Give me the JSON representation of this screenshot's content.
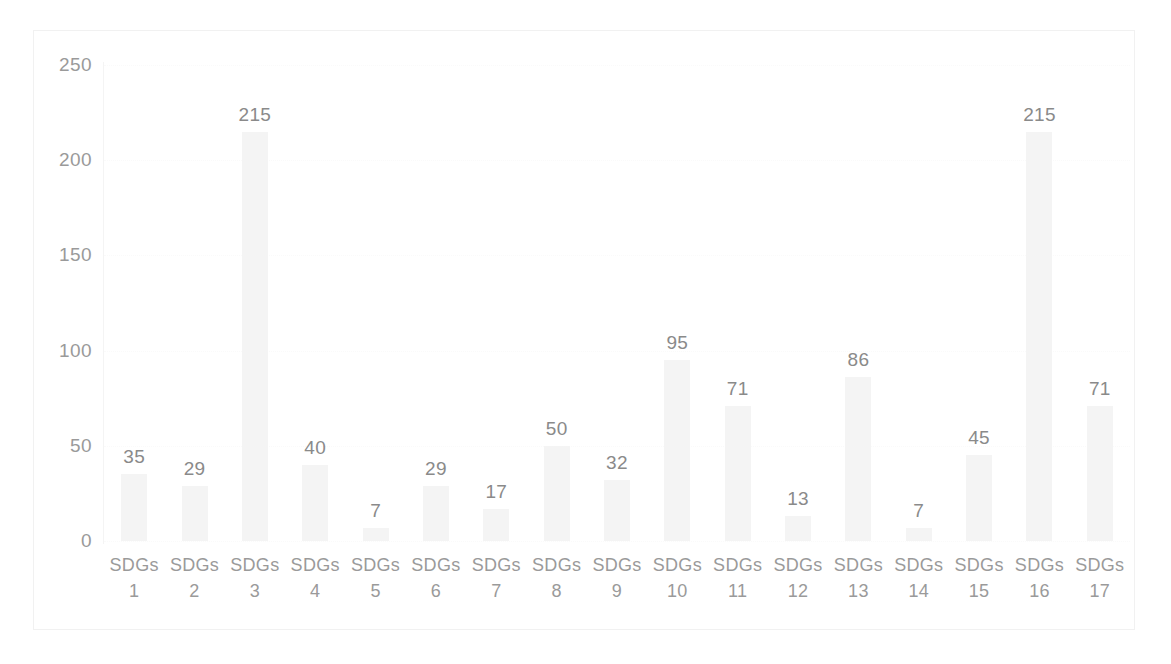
{
  "chart_data": {
    "type": "bar",
    "title": "",
    "subtitle": "",
    "xlabel": "",
    "ylabel": "",
    "categories": [
      "SDGs 1",
      "SDGs 2",
      "SDGs 3",
      "SDGs 4",
      "SDGs 5",
      "SDGs 6",
      "SDGs 7",
      "SDGs 8",
      "SDGs 9",
      "SDGs 10",
      "SDGs 11",
      "SDGs 12",
      "SDGs 13",
      "SDGs 14",
      "SDGs 15",
      "SDGs 16",
      "SDGs 17"
    ],
    "category_prefix": "SDGs",
    "category_numbers": [
      "1",
      "2",
      "3",
      "4",
      "5",
      "6",
      "7",
      "8",
      "9",
      "10",
      "11",
      "12",
      "13",
      "14",
      "15",
      "16",
      "17"
    ],
    "values": [
      35,
      29,
      215,
      40,
      7,
      29,
      17,
      50,
      32,
      95,
      71,
      13,
      86,
      7,
      45,
      215,
      71
    ],
    "value_labels": [
      "35",
      "29",
      "215",
      "40",
      "7",
      "29",
      "17",
      "50",
      "32",
      "95",
      "71",
      "13",
      "86",
      "7",
      "45",
      "215",
      "71"
    ],
    "ylim": [
      0,
      250
    ],
    "ytick_values": [
      0,
      50,
      100,
      150,
      200,
      250
    ],
    "ytick_labels": [
      "0",
      "50",
      "100",
      "150",
      "200",
      "250"
    ],
    "grid": true,
    "grid_axis": "y",
    "legend": false,
    "legend_position": "none",
    "data_labels": true,
    "bar_color": "#f4f4f4",
    "label_color": "#8a8a8a",
    "axis_label_color": "#9a9a9a",
    "gridline_color": "#fafafa",
    "frame_color": "#f1f1f1",
    "background_color": "#ffffff"
  }
}
